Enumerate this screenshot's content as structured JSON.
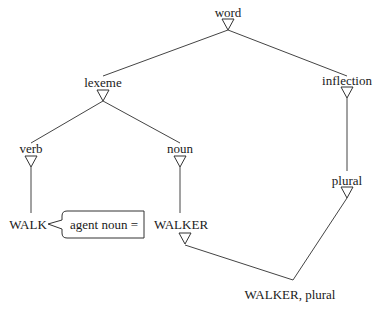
{
  "diagram": {
    "type": "inheritance-hierarchy",
    "nodes": {
      "word": "word",
      "lexeme": "lexeme",
      "inflection": "inflection",
      "verb": "verb",
      "noun": "noun",
      "plural": "plural",
      "walk": "WALK",
      "walker": "WALKER",
      "walker_plural": "WALKER, plural"
    },
    "callout": {
      "text": "agent noun ="
    },
    "edges": [
      [
        "word",
        "lexeme"
      ],
      [
        "word",
        "inflection"
      ],
      [
        "lexeme",
        "verb"
      ],
      [
        "lexeme",
        "noun"
      ],
      [
        "inflection",
        "plural"
      ],
      [
        "verb",
        "WALK"
      ],
      [
        "noun",
        "WALKER"
      ],
      [
        "WALKER",
        "WALKER, plural"
      ],
      [
        "plural",
        "WALKER, plural"
      ]
    ]
  }
}
